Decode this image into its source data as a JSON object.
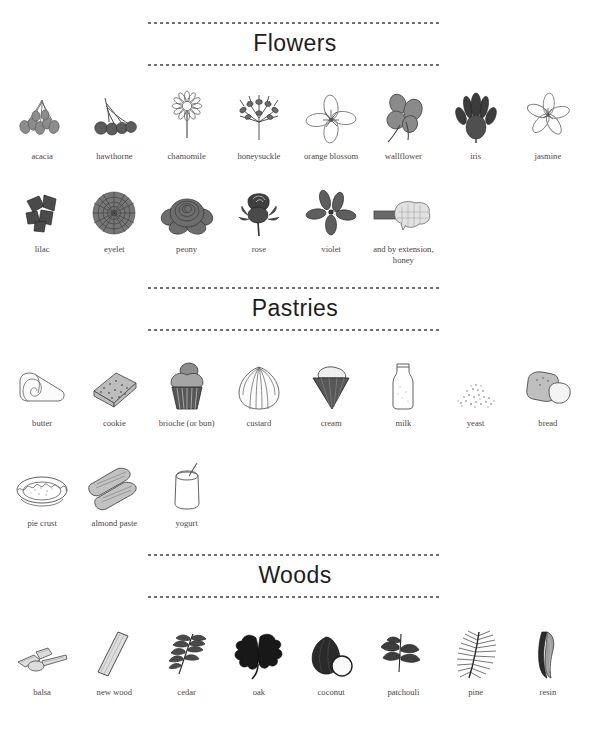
{
  "page": {
    "background": "#ffffff",
    "text_color": "#4a4646",
    "title_color": "#1d1d1d",
    "rule_color": "#6f6f6f"
  },
  "sections": [
    {
      "id": "flowers",
      "title": "Flowers",
      "rows": [
        [
          {
            "label": "acacia",
            "icon": "acacia-flower-icon"
          },
          {
            "label": "hawthorne",
            "icon": "hawthorne-berries-icon"
          },
          {
            "label": "chamomile",
            "icon": "chamomile-flower-icon"
          },
          {
            "label": "honeysuckle",
            "icon": "honeysuckle-flower-icon"
          },
          {
            "label": "orange blossom",
            "icon": "orange-blossom-flower-icon"
          },
          {
            "label": "wallflower",
            "icon": "wallflower-flower-icon"
          },
          {
            "label": "iris",
            "icon": "iris-flower-icon"
          },
          {
            "label": "jasmine",
            "icon": "jasmine-flower-icon"
          }
        ],
        [
          {
            "label": "lilac",
            "icon": "lilac-flower-icon"
          },
          {
            "label": "eyelet",
            "icon": "eyelet-flower-icon"
          },
          {
            "label": "peony",
            "icon": "peony-flower-icon"
          },
          {
            "label": "rose",
            "icon": "rose-flower-icon"
          },
          {
            "label": "violet",
            "icon": "violet-flower-icon"
          },
          {
            "label": "and by extension,\nhoney",
            "icon": "honeycomb-icon"
          }
        ]
      ]
    },
    {
      "id": "pastries",
      "title": "Pastries",
      "rows": [
        [
          {
            "label": "butter",
            "icon": "butter-curl-icon"
          },
          {
            "label": "cookie",
            "icon": "cookie-biscuit-icon"
          },
          {
            "label": "brioche (or bun)",
            "icon": "brioche-bun-icon"
          },
          {
            "label": "custard",
            "icon": "custard-swirl-icon"
          },
          {
            "label": "cream",
            "icon": "cream-cone-icon"
          },
          {
            "label": "milk",
            "icon": "milk-bottle-icon"
          },
          {
            "label": "yeast",
            "icon": "yeast-granules-icon"
          },
          {
            "label": "bread",
            "icon": "bread-slices-icon"
          }
        ],
        [
          {
            "label": "pie crust",
            "icon": "pie-crust-icon"
          },
          {
            "label": "almond paste",
            "icon": "almond-paste-icon"
          },
          {
            "label": "yogurt",
            "icon": "yogurt-jar-icon"
          }
        ]
      ]
    },
    {
      "id": "woods",
      "title": "Woods",
      "rows": [
        [
          {
            "label": "balsa",
            "icon": "balsa-wood-icon"
          },
          {
            "label": "new wood",
            "icon": "new-wood-plank-icon"
          },
          {
            "label": "cedar",
            "icon": "cedar-branch-icon"
          },
          {
            "label": "oak",
            "icon": "oak-leaf-icon"
          },
          {
            "label": "coconut",
            "icon": "coconut-icon"
          },
          {
            "label": "patchouli",
            "icon": "patchouli-leaf-icon"
          },
          {
            "label": "pine",
            "icon": "pine-branch-icon"
          },
          {
            "label": "resin",
            "icon": "resin-icon"
          }
        ]
      ]
    }
  ]
}
